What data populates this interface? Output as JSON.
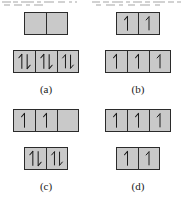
{
  "figure": {
    "kind": "orbital-box-diagram",
    "colors": {
      "box_fill": "#c9c9c9",
      "box_border": "#2b2b2b",
      "arrow": "#1a1a1a",
      "page_background": "#ffffff",
      "caption_text": "#1a1a1a"
    },
    "icon_names": {
      "spin_up": "spin-up-arrow-icon",
      "spin_down": "spin-down-arrow-icon",
      "spin_paired": "spin-paired-arrows-icon",
      "empty": "empty-orbital-icon"
    },
    "options": [
      {
        "id": "a",
        "caption": "(a)",
        "rows": [
          {
            "name": "upper-row",
            "cells": [
              "empty",
              "empty"
            ]
          },
          {
            "name": "lower-row",
            "cells": [
              "paired",
              "paired",
              "paired"
            ]
          }
        ]
      },
      {
        "id": "b",
        "caption": "(b)",
        "rows": [
          {
            "name": "upper-row",
            "cells": [
              "up",
              "up"
            ]
          },
          {
            "name": "lower-row",
            "cells": [
              "up",
              "up",
              "up"
            ]
          }
        ]
      },
      {
        "id": "c",
        "caption": "(c)",
        "rows": [
          {
            "name": "upper-row",
            "cells": [
              "up",
              "up",
              "empty"
            ]
          },
          {
            "name": "lower-row",
            "cells": [
              "paired",
              "paired"
            ]
          }
        ]
      },
      {
        "id": "d",
        "caption": "(d)",
        "rows": [
          {
            "name": "upper-row",
            "cells": [
              "up",
              "up",
              "up"
            ]
          },
          {
            "name": "lower-row",
            "cells": [
              "up",
              "up"
            ]
          }
        ]
      }
    ]
  },
  "top_cutoff": {
    "present": true,
    "fragments": [
      [
        2,
        1,
        9
      ],
      [
        13,
        1,
        5
      ],
      [
        21,
        1,
        13
      ],
      [
        37,
        1,
        4
      ],
      [
        44,
        1,
        10
      ],
      [
        58,
        1,
        7
      ],
      [
        69,
        1,
        3
      ],
      [
        75,
        1,
        2
      ],
      [
        92,
        1,
        8
      ],
      [
        103,
        1,
        6
      ],
      [
        112,
        1,
        11
      ],
      [
        126,
        1,
        4
      ],
      [
        133,
        1,
        9
      ],
      [
        145,
        1,
        5
      ],
      [
        153,
        1,
        12
      ],
      [
        168,
        1,
        6
      ],
      [
        177,
        1,
        4
      ],
      [
        4,
        4,
        6
      ],
      [
        14,
        4,
        8
      ],
      [
        26,
        4,
        4
      ],
      [
        34,
        4,
        9
      ],
      [
        96,
        4,
        5
      ],
      [
        106,
        4,
        9
      ],
      [
        119,
        4,
        4
      ],
      [
        128,
        4,
        7
      ],
      [
        140,
        4,
        10
      ],
      [
        155,
        4,
        5
      ]
    ]
  }
}
